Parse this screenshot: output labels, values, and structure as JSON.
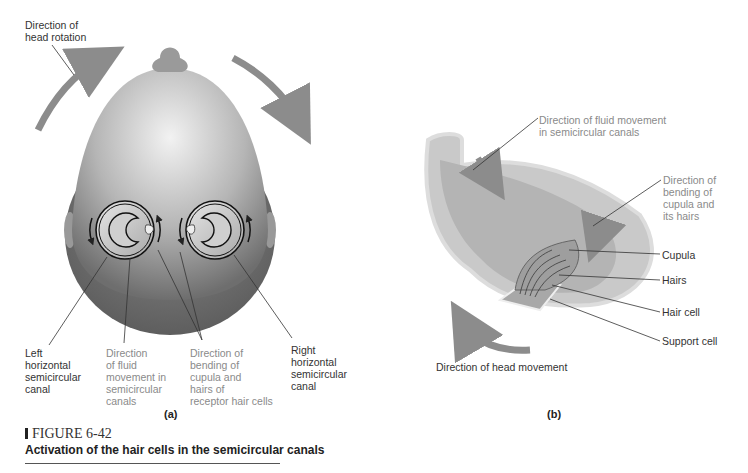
{
  "panel_a": {
    "label": "(a)",
    "callouts": {
      "head_rotation": "Direction of\nhead rotation",
      "left_canal": "Left\nhorizontal\nsemicircular\ncanal",
      "fluid_movement": "Direction\nof fluid\nmovement in\nsemicircular\ncanals",
      "bending": "Direction of\nbending of\ncupula and\nhairs of\nreceptor hair cells",
      "right_canal": "Right\nhorizontal\nsemicircular\ncanal"
    }
  },
  "panel_b": {
    "label": "(b)",
    "callouts": {
      "fluid_movement": "Direction of fluid movement\nin semicircular canals",
      "bending": "Direction of\nbending of\ncupula and\nits hairs",
      "cupula": "Cupula",
      "hairs": "Hairs",
      "hair_cell": "Hair cell",
      "support_cell": "Support cell",
      "head_movement": "Direction of head movement"
    }
  },
  "figure": {
    "number": "FIGURE 6-42",
    "caption": "Activation of the hair cells in the semicircular canals"
  },
  "colors": {
    "arrow": "#8c8c8c",
    "label_dark": "#333333",
    "label_gray": "#8a8a8a"
  }
}
